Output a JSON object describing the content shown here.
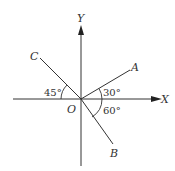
{
  "diagram": {
    "axes": {
      "x_label": "X",
      "y_label": "Y",
      "origin_label": "O"
    },
    "rays": [
      {
        "label": "A",
        "angle_label": "30°",
        "description": "30° above +X axis"
      },
      {
        "label": "B",
        "angle_label": "60°",
        "description": "60° below +X axis"
      },
      {
        "label": "C",
        "angle_label": "45°",
        "description": "45° above -X axis"
      }
    ],
    "colors": {
      "line": "#333333",
      "background": "#ffffff"
    }
  }
}
